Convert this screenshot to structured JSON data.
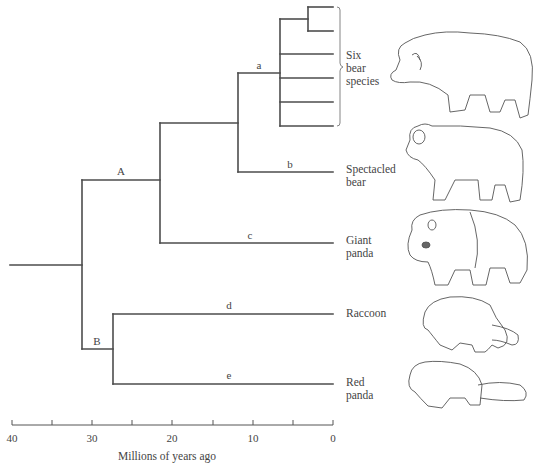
{
  "diagram": {
    "type": "phylogenetic-tree",
    "axis": {
      "label": "Millions of years ago",
      "ticks": [
        "40",
        "30",
        "20",
        "10",
        "0"
      ],
      "tick_values": [
        40,
        35,
        30,
        25,
        20,
        15,
        10,
        5,
        0
      ],
      "range": [
        40,
        0
      ]
    },
    "branch_labels": {
      "A": "A",
      "B": "B",
      "a": "a",
      "b": "b",
      "c": "c",
      "d": "d",
      "e": "e"
    },
    "nodes": {
      "root_mya": 40,
      "bear_panda_raccoon_split_mya": 31.3,
      "A_node_mya": 21.6,
      "spectacled_split_mya": 11.8,
      "six_bears_crown_mya": 6.6,
      "six_bears_subsplit_mya": 3.1,
      "B_node_mya": 27.4
    },
    "taxa": [
      {
        "id": "six-bears",
        "line1": "Six",
        "line2": "bear",
        "line3": "species",
        "branch": "a",
        "tips": 6
      },
      {
        "id": "spectacled-bear",
        "line1": "Spectacled",
        "line2": "bear",
        "branch": "b"
      },
      {
        "id": "giant-panda",
        "line1": "Giant",
        "line2": "panda",
        "branch": "c"
      },
      {
        "id": "raccoon",
        "line1": "Raccoon",
        "branch": "d"
      },
      {
        "id": "red-panda",
        "line1": "Red",
        "line2": "panda",
        "branch": "e"
      }
    ],
    "illustrations": [
      "bear",
      "spectacled-bear",
      "giant-panda",
      "raccoon",
      "red-panda"
    ]
  }
}
